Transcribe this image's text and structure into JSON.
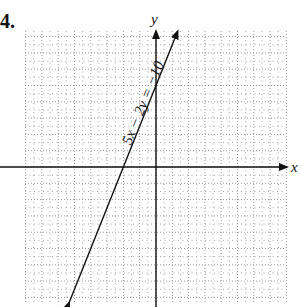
{
  "problem": {
    "number": "4."
  },
  "chart_data": {
    "type": "line",
    "title": "",
    "xlabel": "x",
    "ylabel": "y",
    "xlim": [
      -8,
      8
    ],
    "ylim": [
      -8.4,
      8.3
    ],
    "grid": true,
    "grid_major_step": 1,
    "grid_minor_step": 0.5,
    "grid_style": "dotted",
    "series": [
      {
        "name": "5x − 2y = −10",
        "equation": "5x − 2y = −10",
        "slope": 2.5,
        "intercept": 5,
        "x_intercept": -2,
        "y_intercept": 5,
        "points": [
          [
            -5.32,
            -8.3
          ],
          [
            -2,
            0
          ],
          [
            0,
            5
          ],
          [
            1.33,
            8.33
          ]
        ],
        "arrows": "both"
      }
    ],
    "annotations": [
      {
        "text": "5x − 2y = −10",
        "position": "along line",
        "rotation_deg": -68
      }
    ]
  },
  "layout": {
    "origin_px": [
      156,
      167
    ],
    "unit_px": 16.3,
    "grid_left_px": 25,
    "grid_right_px": 286,
    "grid_top_px": 31,
    "grid_bottom_px": 303,
    "line_color": "#111111",
    "grid_color": "#9a9a9a"
  }
}
